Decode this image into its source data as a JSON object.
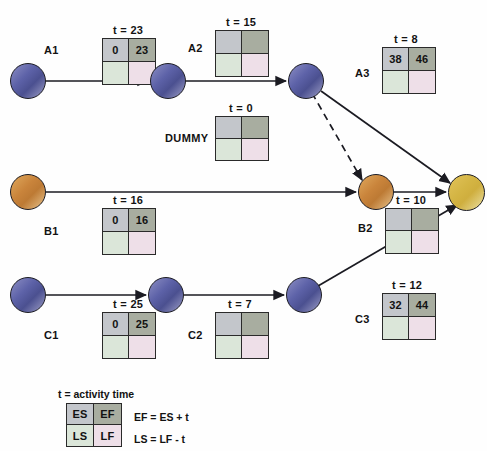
{
  "diagram": {
    "colors": {
      "node_blue": "#5d62a8",
      "node_orange": "#c9843b",
      "node_gold": "#d4b544",
      "cell_es": "#c3c6cb",
      "cell_ef": "#a8ada0",
      "cell_ls": "#dbe6d9",
      "cell_lf": "#eedfe8",
      "edge": "#1b1b22"
    },
    "activities": [
      {
        "id": "a1",
        "name": "A1",
        "time_label": "t = 23",
        "es": "0",
        "ef": "23",
        "ls": "",
        "lf": ""
      },
      {
        "id": "a2",
        "name": "A2",
        "time_label": "t = 15",
        "es": "",
        "ef": "",
        "ls": "",
        "lf": ""
      },
      {
        "id": "dummy",
        "name": "DUMMY",
        "time_label": "t = 0",
        "es": "",
        "ef": "",
        "ls": "",
        "lf": ""
      },
      {
        "id": "a3",
        "name": "A3",
        "time_label": "t = 8",
        "es": "38",
        "ef": "46",
        "ls": "",
        "lf": ""
      },
      {
        "id": "b1",
        "name": "B1",
        "time_label": "t = 16",
        "es": "0",
        "ef": "16",
        "ls": "",
        "lf": ""
      },
      {
        "id": "b2",
        "name": "B2",
        "time_label": "t = 10",
        "es": "",
        "ef": "",
        "ls": "",
        "lf": ""
      },
      {
        "id": "c1",
        "name": "C1",
        "time_label": "t = 25",
        "es": "0",
        "ef": "25",
        "ls": "",
        "lf": ""
      },
      {
        "id": "c2",
        "name": "C2",
        "time_label": "t = 7",
        "es": "",
        "ef": "",
        "ls": "",
        "lf": ""
      },
      {
        "id": "c3",
        "name": "C3",
        "time_label": "t = 12",
        "es": "32",
        "ef": "44",
        "ls": "",
        "lf": ""
      }
    ],
    "nodes": [
      {
        "id": "n1",
        "color": "blue"
      },
      {
        "id": "n2",
        "color": "blue"
      },
      {
        "id": "n3",
        "color": "blue"
      },
      {
        "id": "n4",
        "color": "orange"
      },
      {
        "id": "n5",
        "color": "orange"
      },
      {
        "id": "n6",
        "color": "gold"
      },
      {
        "id": "n7",
        "color": "blue"
      },
      {
        "id": "n8",
        "color": "blue"
      },
      {
        "id": "n9",
        "color": "blue"
      }
    ]
  },
  "legend": {
    "title": "t = activity time",
    "es": "ES",
    "ef": "EF",
    "ls": "LS",
    "lf": "LF",
    "equation_ef": "EF = ES + t",
    "equation_ls": "LS = LF - t"
  }
}
